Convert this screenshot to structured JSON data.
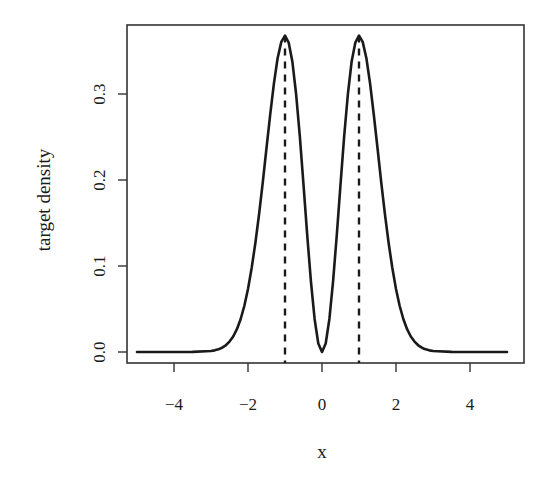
{
  "chart_data": {
    "type": "line",
    "title": "",
    "xlabel": "x",
    "ylabel": "target density",
    "xlim": [
      -5.3,
      5.4
    ],
    "ylim": [
      -0.013,
      0.38
    ],
    "grid": false,
    "legend": null,
    "x_ticks": [
      -4,
      -2,
      0,
      2,
      4
    ],
    "x_tick_labels": [
      "−4",
      "−2",
      "0",
      "2",
      "4"
    ],
    "y_ticks": [
      0.0,
      0.1,
      0.2,
      0.3
    ],
    "y_tick_labels": [
      "0.0",
      "0.1",
      "0.2",
      "0.3"
    ],
    "series": [
      {
        "name": "target density",
        "style": "solid",
        "color": "#1a1a1a",
        "x": [
          -5.0,
          -4.5,
          -4.0,
          -3.5,
          -3.0,
          -2.9,
          -2.8,
          -2.7,
          -2.6,
          -2.5,
          -2.4,
          -2.3,
          -2.2,
          -2.1,
          -2.0,
          -1.9,
          -1.8,
          -1.7,
          -1.6,
          -1.5,
          -1.4,
          -1.3,
          -1.2,
          -1.1,
          -1.0,
          -0.9,
          -0.8,
          -0.7,
          -0.6,
          -0.5,
          -0.4,
          -0.3,
          -0.2,
          -0.1,
          0.0,
          0.1,
          0.2,
          0.3,
          0.4,
          0.5,
          0.6,
          0.7,
          0.8,
          0.9,
          1.0,
          1.1,
          1.2,
          1.3,
          1.4,
          1.5,
          1.6,
          1.7,
          1.8,
          1.9,
          2.0,
          2.1,
          2.2,
          2.3,
          2.4,
          2.5,
          2.6,
          2.7,
          2.8,
          2.9,
          3.0,
          3.5,
          4.0,
          4.5,
          5.0
        ],
        "y": [
          0.0,
          0.0,
          0.0,
          0.0001,
          0.0011,
          0.0019,
          0.0031,
          0.005,
          0.0078,
          0.0121,
          0.018,
          0.0265,
          0.0381,
          0.0535,
          0.0733,
          0.0979,
          0.127,
          0.1605,
          0.1975,
          0.2372,
          0.2759,
          0.312,
          0.3416,
          0.3606,
          0.3679,
          0.3597,
          0.3374,
          0.3,
          0.2512,
          0.1947,
          0.1363,
          0.0823,
          0.0384,
          0.0099,
          0.0,
          0.0099,
          0.0384,
          0.0823,
          0.1363,
          0.1947,
          0.2512,
          0.3,
          0.3374,
          0.3597,
          0.3679,
          0.3606,
          0.3416,
          0.312,
          0.2759,
          0.2372,
          0.1975,
          0.1605,
          0.127,
          0.0979,
          0.0733,
          0.0535,
          0.0381,
          0.0265,
          0.018,
          0.0121,
          0.0078,
          0.005,
          0.0031,
          0.0019,
          0.0011,
          0.0001,
          0.0,
          0.0,
          0.0
        ]
      }
    ],
    "vertical_lines": [
      {
        "x": -1,
        "style": "dashed",
        "color": "#1a1a1a",
        "y_top": 0.3679
      },
      {
        "x": 1,
        "style": "dashed",
        "color": "#1a1a1a",
        "y_top": 0.3679
      }
    ]
  },
  "layout": {
    "plot_box": {
      "left": 127,
      "top": 25,
      "right": 524,
      "bottom": 363
    },
    "x_origin_px": 322,
    "px_per_x_unit": 37,
    "y_zero_px": 352,
    "px_per_y_unit": 860
  }
}
